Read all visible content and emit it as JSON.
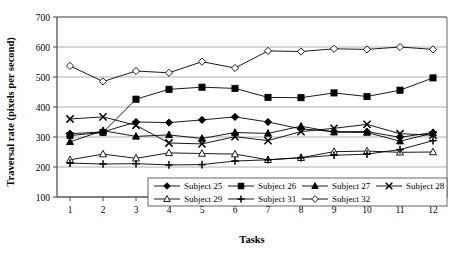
{
  "chart_data": {
    "type": "line",
    "title": "",
    "xlabel": "Tasks",
    "ylabel": "Traversal rate (pixels per second)",
    "x": [
      1,
      2,
      3,
      4,
      5,
      6,
      7,
      8,
      9,
      10,
      11,
      12
    ],
    "xticklabels": [
      "1",
      "2",
      "3",
      "4",
      "5",
      "6",
      "7",
      "8",
      "9",
      "10",
      "11",
      "12"
    ],
    "yticklabels": [
      "100",
      "200",
      "300",
      "400",
      "500",
      "600",
      "700"
    ],
    "yticks": [
      100,
      200,
      300,
      400,
      500,
      600,
      700
    ],
    "ylim": [
      100,
      700
    ],
    "xlim": [
      0.5,
      12.5
    ],
    "grid": "horizontal",
    "legend_position": "inside-bottom-center",
    "series": [
      {
        "name": "Subject 25",
        "marker": "filled-diamond",
        "values": [
          311,
          317,
          350,
          348,
          357,
          367,
          350,
          327,
          318,
          318,
          299,
          315
        ]
      },
      {
        "name": "Subject 26",
        "marker": "filled-square",
        "values": [
          305,
          315,
          426,
          459,
          466,
          462,
          432,
          431,
          447,
          435,
          456,
          497
        ]
      },
      {
        "name": "Subject 27",
        "marker": "filled-triangle",
        "values": [
          284,
          321,
          302,
          307,
          295,
          315,
          312,
          336,
          316,
          315,
          286,
          313
        ]
      },
      {
        "name": "Subject 28",
        "marker": "cross-x",
        "values": [
          360,
          367,
          339,
          280,
          277,
          301,
          288,
          318,
          329,
          342,
          311,
          306
        ]
      },
      {
        "name": "Subject 29",
        "marker": "open-triangle",
        "values": [
          224,
          243,
          229,
          247,
          245,
          243,
          224,
          231,
          251,
          253,
          249,
          250
        ]
      },
      {
        "name": "Subject 31",
        "marker": "plus",
        "values": [
          213,
          210,
          211,
          207,
          208,
          220,
          224,
          231,
          239,
          243,
          258,
          288
        ]
      },
      {
        "name": "Subject 32",
        "marker": "open-diamond",
        "values": [
          537,
          485,
          520,
          514,
          551,
          530,
          587,
          585,
          594,
          592,
          600,
          592
        ]
      }
    ]
  },
  "style": {
    "line_color": "#000000",
    "marker_fill": "#000000",
    "marker_open_fill": "#ffffff",
    "grid_color": "#9a9a9a",
    "frame_color": "#555555",
    "background": "#ffffff"
  },
  "legend": {
    "entries": [
      {
        "label": "Subject 25",
        "marker": "filled-diamond"
      },
      {
        "label": "Subject 26",
        "marker": "filled-square"
      },
      {
        "label": "Subject 27",
        "marker": "filled-triangle"
      },
      {
        "label": "Subject 28",
        "marker": "cross-x"
      },
      {
        "label": "Subject 29",
        "marker": "open-triangle"
      },
      {
        "label": "Subject 31",
        "marker": "plus"
      },
      {
        "label": "Subject 32",
        "marker": "open-diamond"
      }
    ]
  }
}
